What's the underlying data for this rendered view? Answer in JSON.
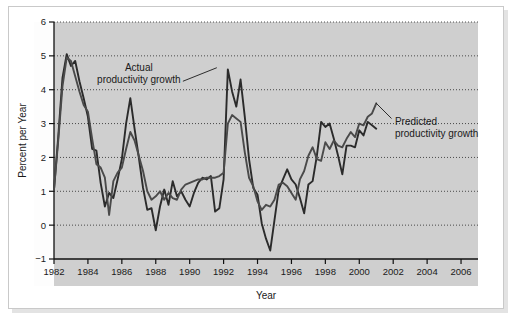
{
  "figure": {
    "background_color": "#ffffff",
    "panel_color": "#cfcfcf",
    "frame_color": "#c9c9c9"
  },
  "chart_data": {
    "type": "line",
    "title": "",
    "xlabel": "Year",
    "ylabel": "Percent per Year",
    "xlim": [
      1982,
      2007
    ],
    "ylim": [
      -1,
      6
    ],
    "xticks": [
      1982,
      1984,
      1986,
      1988,
      1990,
      1992,
      1994,
      1996,
      1998,
      2000,
      2002,
      2004,
      2006
    ],
    "xtick_labels": [
      "1982",
      "1984",
      "1986",
      "1988",
      "1990",
      "1992",
      "1994",
      "1996",
      "1998",
      "2000",
      "2002",
      "2004",
      "2006"
    ],
    "yticks": [
      -1,
      0,
      1,
      2,
      3,
      4,
      5,
      6
    ],
    "ytick_labels": [
      "−1",
      "0",
      "1",
      "2",
      "3",
      "4",
      "5",
      "6"
    ],
    "grid": true,
    "grid_style": "dotted",
    "grid_color": "#3a3a3a",
    "legend": "none",
    "annotations": [
      {
        "name": "actual-annotation",
        "text_line1": "Actual",
        "text_line2": "productivity growth",
        "text_x": 1987.0,
        "text_y": 4.55,
        "leader_from_x": 1989.6,
        "leader_from_y": 4.25,
        "leader_to_x": 1991.6,
        "leader_to_y": 4.65
      },
      {
        "name": "predicted-annotation",
        "text_line1": "Predicted",
        "text_line2": "productivity growth",
        "text_x": 2002.1,
        "text_y": 2.95,
        "leader_from_x": 2001.9,
        "leader_from_y": 3.15,
        "leader_to_x": 2001.0,
        "leader_to_y": 3.6
      }
    ],
    "series": [
      {
        "name": "Actual productivity growth",
        "color": "#2b2b2b",
        "line_width": 1.9,
        "x": [
          1982.0,
          1982.25,
          1982.5,
          1982.75,
          1983.0,
          1983.25,
          1983.5,
          1983.75,
          1984.0,
          1984.25,
          1984.5,
          1984.75,
          1985.0,
          1985.25,
          1985.5,
          1985.75,
          1986.0,
          1986.25,
          1986.5,
          1986.75,
          1987.0,
          1987.25,
          1987.5,
          1987.75,
          1988.0,
          1988.25,
          1988.5,
          1988.75,
          1989.0,
          1989.25,
          1989.5,
          1989.75,
          1990.0,
          1990.25,
          1990.5,
          1990.75,
          1991.0,
          1991.25,
          1991.5,
          1991.75,
          1992.0,
          1992.25,
          1992.5,
          1992.75,
          1993.0,
          1993.25,
          1993.5,
          1993.75,
          1994.0,
          1994.25,
          1994.5,
          1994.75,
          1995.0,
          1995.25,
          1995.5,
          1995.75,
          1996.0,
          1996.25,
          1996.5,
          1996.75,
          1997.0,
          1997.25,
          1997.5,
          1997.75,
          1998.0,
          1998.25,
          1998.5,
          1998.75,
          1999.0,
          1999.25,
          1999.5,
          1999.75,
          2000.0,
          2000.25,
          2000.5,
          2000.75,
          2001.0
        ],
        "y": [
          1.05,
          2.6,
          4.35,
          5.05,
          4.7,
          4.85,
          4.25,
          3.75,
          3.2,
          2.25,
          2.2,
          1.25,
          0.55,
          0.95,
          0.8,
          1.35,
          1.95,
          3.0,
          3.75,
          2.85,
          2.0,
          1.1,
          0.45,
          0.5,
          -0.15,
          0.55,
          1.05,
          0.6,
          1.3,
          0.85,
          1.0,
          0.75,
          0.55,
          0.95,
          1.25,
          1.4,
          1.35,
          1.45,
          0.4,
          0.5,
          1.35,
          4.6,
          3.95,
          3.5,
          4.3,
          3.2,
          1.95,
          1.1,
          0.9,
          0.05,
          -0.4,
          -0.75,
          0.15,
          1.05,
          1.35,
          1.65,
          1.35,
          1.2,
          0.8,
          0.35,
          1.2,
          1.3,
          2.05,
          3.05,
          2.9,
          3.0,
          2.55,
          2.05,
          1.5,
          2.35,
          2.35,
          2.3,
          2.8,
          2.65,
          3.05,
          2.95,
          2.85
        ]
      },
      {
        "name": "Predicted productivity growth",
        "color": "#4a4a4a",
        "line_width": 1.9,
        "x": [
          1982.0,
          1982.25,
          1982.5,
          1982.75,
          1983.0,
          1983.25,
          1983.5,
          1983.75,
          1984.0,
          1984.25,
          1984.5,
          1984.75,
          1985.0,
          1985.25,
          1985.5,
          1985.75,
          1986.0,
          1986.25,
          1986.5,
          1986.75,
          1987.0,
          1987.25,
          1987.5,
          1987.75,
          1988.0,
          1988.25,
          1988.5,
          1988.75,
          1989.0,
          1989.25,
          1989.5,
          1989.75,
          1990.0,
          1990.25,
          1990.5,
          1990.75,
          1991.0,
          1991.25,
          1991.5,
          1991.75,
          1992.0,
          1992.25,
          1992.5,
          1992.75,
          1993.0,
          1993.25,
          1993.5,
          1993.75,
          1994.0,
          1994.25,
          1994.5,
          1994.75,
          1995.0,
          1995.25,
          1995.5,
          1995.75,
          1996.0,
          1996.25,
          1996.5,
          1996.75,
          1997.0,
          1997.25,
          1997.5,
          1997.75,
          1998.0,
          1998.25,
          1998.5,
          1998.75,
          1999.0,
          1999.25,
          1999.5,
          1999.75,
          2000.0,
          2000.25,
          2000.5,
          2000.75,
          2001.0
        ],
        "y": [
          1.05,
          2.5,
          4.1,
          4.95,
          4.85,
          4.4,
          3.95,
          3.55,
          3.35,
          2.55,
          1.8,
          1.7,
          1.4,
          0.3,
          1.3,
          1.55,
          1.7,
          2.25,
          2.75,
          2.5,
          2.05,
          1.6,
          1.0,
          0.75,
          0.85,
          1.0,
          0.75,
          0.95,
          0.8,
          0.75,
          1.05,
          1.2,
          1.25,
          1.3,
          1.35,
          1.35,
          1.4,
          1.4,
          1.4,
          1.45,
          1.55,
          3.0,
          3.25,
          3.15,
          3.05,
          2.15,
          1.4,
          1.15,
          0.7,
          0.45,
          0.6,
          0.55,
          0.75,
          1.2,
          1.25,
          1.15,
          0.95,
          0.75,
          1.35,
          1.6,
          2.05,
          2.3,
          1.95,
          1.9,
          2.45,
          2.25,
          2.5,
          2.35,
          2.3,
          2.55,
          2.75,
          2.6,
          3.0,
          2.95,
          3.2,
          3.3,
          3.6
        ]
      }
    ]
  }
}
